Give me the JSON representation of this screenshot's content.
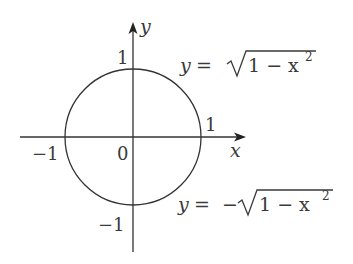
{
  "diagram": {
    "axes": {
      "x_label": "x",
      "y_label": "y",
      "origin_label": "0"
    },
    "ticks": {
      "x_pos": "1",
      "x_neg": "−1",
      "y_pos": "1",
      "y_neg": "−1"
    },
    "curves": {
      "upper": {
        "lhs": "y",
        "eq": "=",
        "sign": "",
        "radicand": "1 − x",
        "exp": "2"
      },
      "lower": {
        "lhs": "y",
        "eq": "=",
        "sign": "−",
        "radicand": "1 − x",
        "exp": "2"
      }
    },
    "colors": {
      "line": "#333333",
      "text": "#3a3a3a",
      "background": "#ffffff"
    }
  }
}
